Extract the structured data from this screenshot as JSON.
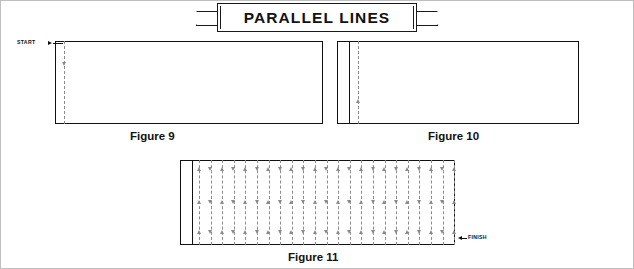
{
  "title": "PARALLEL LINES",
  "figures": [
    {
      "id": "figure-9",
      "caption": "Figure 9",
      "start_label": "START",
      "panel": {
        "x": 55,
        "y": 41,
        "w": 268,
        "h": 83
      },
      "guide_x": 64,
      "marks": [
        {
          "type": "arrow-right",
          "x": 51,
          "y": 43
        },
        {
          "type": "tick",
          "x": 64,
          "y": 43
        },
        {
          "type": "arrow-down",
          "x": 64,
          "y": 63
        }
      ]
    },
    {
      "id": "figure-10",
      "caption": "Figure 10",
      "panel": {
        "x": 337,
        "y": 41,
        "w": 242,
        "h": 83
      },
      "inner_strip": {
        "x": 337,
        "y": 41,
        "w": 13,
        "h": 83
      },
      "marks": [
        {
          "type": "arrow-up",
          "x": 358,
          "y": 100
        }
      ]
    },
    {
      "id": "figure-11",
      "caption": "Figure 11",
      "finish_label": "FINISH",
      "panel": {
        "x": 180,
        "y": 160,
        "w": 275,
        "h": 85
      },
      "inner_strip": {
        "x": 180,
        "y": 160,
        "w": 13,
        "h": 85
      },
      "column_count": 23,
      "column_spacing": 11.6,
      "finish_arrow": {
        "x": 460,
        "y": 237
      }
    }
  ],
  "colors": {
    "ink": "#111111",
    "guide": "#8a8a8a",
    "frame": "#bfbfbf",
    "paper": "#ffffff"
  }
}
